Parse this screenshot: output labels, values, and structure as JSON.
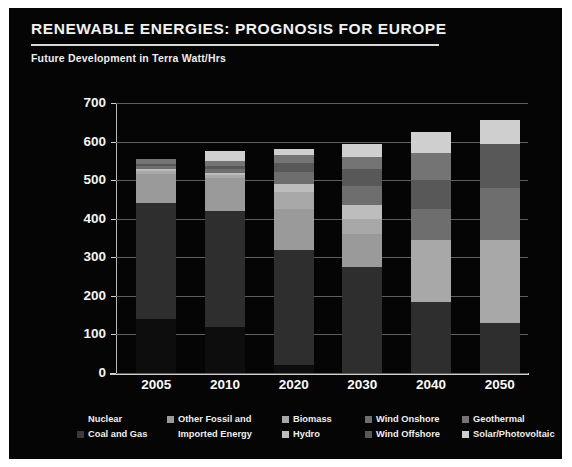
{
  "header": {
    "title": "RENEWABLE ENERGIES: PROGNOSIS FOR EUROPE",
    "subtitle": "Future Development in Terra Watt/Hrs"
  },
  "legend": {
    "columns": [
      {
        "items": [
          {
            "label": "Nuclear",
            "color": "#0b0b0b",
            "swatch_visible": false
          },
          {
            "label": "Coal and Gas",
            "color": "#3a3a3a",
            "swatch_visible": true
          }
        ]
      },
      {
        "items": [
          {
            "label": "Other Fossil and",
            "color": "#9a9a9a",
            "swatch_visible": true
          },
          {
            "label": "Imported Energy",
            "color": "#9a9a9a",
            "swatch_visible": false
          }
        ]
      },
      {
        "items": [
          {
            "label": "Biomass",
            "color": "#a8a8a8",
            "swatch_visible": true
          },
          {
            "label": "Hydro",
            "color": "#bdbdbd",
            "swatch_visible": true
          }
        ]
      },
      {
        "items": [
          {
            "label": "Wind Onshore",
            "color": "#6e6e6e",
            "swatch_visible": true
          },
          {
            "label": "Wind Offshore",
            "color": "#585858",
            "swatch_visible": true
          }
        ]
      },
      {
        "items": [
          {
            "label": "Geothermal",
            "color": "#747474",
            "swatch_visible": true
          },
          {
            "label": "Solar/Photovoltaic",
            "color": "#cfcfcf",
            "swatch_visible": true
          }
        ]
      }
    ]
  },
  "chart_data": {
    "type": "bar",
    "stacked": true,
    "title": "RENEWABLE ENERGIES: PROGNOSIS FOR EUROPE",
    "subtitle": "Future Development in Terra Watt/Hrs",
    "xlabel": "",
    "ylabel": "",
    "unit": "Terra Watt/Hrs",
    "ylim": [
      0,
      700
    ],
    "ytick_step": 100,
    "yticks": [
      700,
      600,
      500,
      400,
      300,
      200,
      100,
      0
    ],
    "grid": true,
    "legend_position": "bottom",
    "categories": [
      "2005",
      "2010",
      "2020",
      "2030",
      "2040",
      "2050"
    ],
    "series": [
      {
        "name": "Nuclear",
        "color": "#0d0d0d",
        "values": [
          140,
          120,
          20,
          0,
          0,
          0
        ]
      },
      {
        "name": "Coal and Gas",
        "color": "#2e2e2e",
        "values": [
          300,
          300,
          300,
          275,
          185,
          130
        ]
      },
      {
        "name": "Other Fossil and Imported Energy",
        "color": "#9a9a9a",
        "values": [
          75,
          85,
          105,
          85,
          0,
          0
        ]
      },
      {
        "name": "Biomass",
        "color": "#a8a8a8",
        "values": [
          8,
          8,
          45,
          40,
          160,
          215
        ]
      },
      {
        "name": "Hydro",
        "color": "#bdbdbd",
        "values": [
          5,
          5,
          20,
          35,
          0,
          0
        ]
      },
      {
        "name": "Wind Onshore",
        "color": "#6e6e6e",
        "values": [
          8,
          10,
          30,
          50,
          80,
          135
        ]
      },
      {
        "name": "Wind Offshore",
        "color": "#585858",
        "values": [
          5,
          8,
          25,
          45,
          75,
          115
        ]
      },
      {
        "name": "Geothermal",
        "color": "#747474",
        "values": [
          14,
          14,
          20,
          30,
          70,
          0
        ]
      },
      {
        "name": "Solar/Photovoltaic",
        "color": "#cfcfcf",
        "values": [
          0,
          25,
          15,
          35,
          55,
          60
        ]
      }
    ],
    "totals": [
      555,
      575,
      580,
      595,
      625,
      655
    ]
  }
}
